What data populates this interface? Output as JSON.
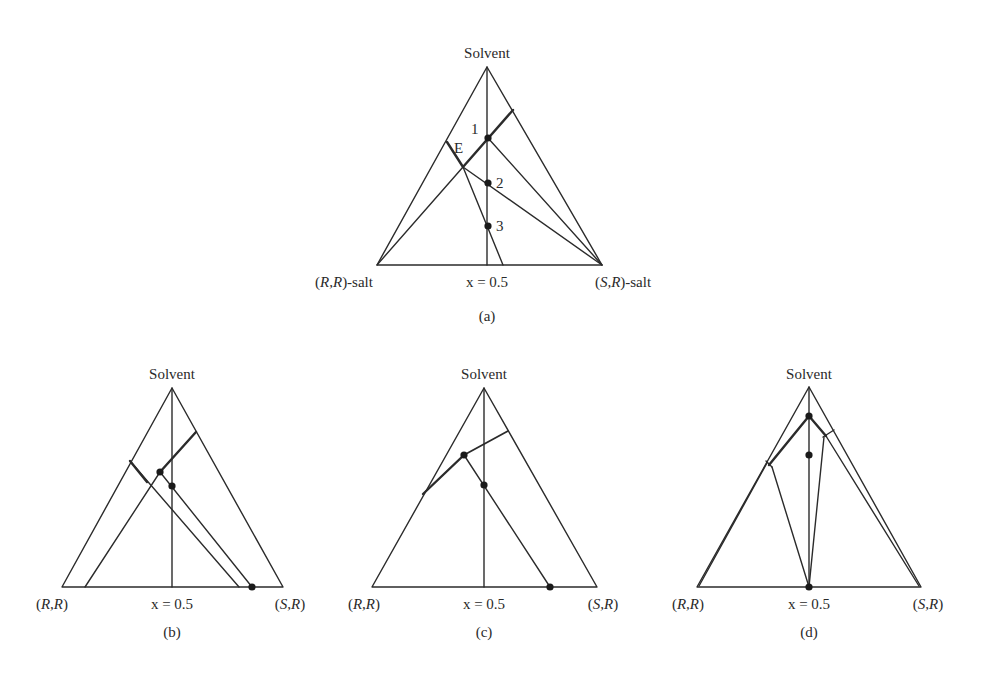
{
  "figure": {
    "panels": [
      {
        "id": "a",
        "caption": "(a)",
        "apex_label": "Solvent",
        "left_label_pre": "(",
        "left_label_it": "R,R",
        "left_label_post": ")-salt",
        "right_label_pre": "(",
        "right_label_it": "S,R",
        "right_label_post": ")-salt",
        "center_label": "x = 0.5",
        "point_labels": {
          "E": "E",
          "p1": "1",
          "p2": "2",
          "p3": "3"
        }
      },
      {
        "id": "b",
        "caption": "(b)",
        "apex_label": "Solvent",
        "left_label_pre": "(",
        "left_label_it": "R,R",
        "left_label_post": ")",
        "right_label_pre": "(",
        "right_label_it": "S,R",
        "right_label_post": ")",
        "center_label": "x = 0.5"
      },
      {
        "id": "c",
        "caption": "(c)",
        "apex_label": "Solvent",
        "left_label_pre": "(",
        "left_label_it": "R,R",
        "left_label_post": ")",
        "right_label_pre": "(",
        "right_label_it": "S,R",
        "right_label_post": ")",
        "center_label": "x = 0.5"
      },
      {
        "id": "d",
        "caption": "(d)",
        "apex_label": "Solvent",
        "left_label_pre": "(",
        "left_label_it": "R,R",
        "left_label_post": ")",
        "right_label_pre": "(",
        "right_label_it": "S,R",
        "right_label_post": ")",
        "center_label": "x = 0.5"
      }
    ],
    "caption_clipped": "",
    "colors": {
      "line": "#2b2b2b",
      "text": "#2a2a2a",
      "background": "#ffffff"
    }
  }
}
